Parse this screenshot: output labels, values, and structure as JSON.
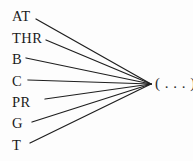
{
  "diagram": {
    "type": "convergence-fan",
    "background_color": "#fdfdfd",
    "line_color": "#1f1f1f",
    "text_color": "#1b1b1b",
    "convergence_point": {
      "x": 151,
      "y": 84
    },
    "target": {
      "label": "( . . . )",
      "x": 155,
      "y": 83
    },
    "nodes": [
      {
        "label": "AT",
        "label_x": 12,
        "label_y": 16,
        "line_x1": 36,
        "line_y1": 19
      },
      {
        "label": "THR",
        "label_x": 12,
        "label_y": 38,
        "line_x1": 46,
        "line_y1": 40
      },
      {
        "label": "B",
        "label_x": 12,
        "label_y": 59,
        "line_x1": 26,
        "line_y1": 58
      },
      {
        "label": "C",
        "label_x": 12,
        "label_y": 81,
        "line_x1": 28,
        "line_y1": 80
      },
      {
        "label": "PR",
        "label_x": 12,
        "label_y": 102,
        "line_x1": 45,
        "line_y1": 99
      },
      {
        "label": "G",
        "label_x": 12,
        "label_y": 123,
        "line_x1": 32,
        "line_y1": 122
      },
      {
        "label": "T",
        "label_x": 12,
        "label_y": 145,
        "line_x1": 30,
        "line_y1": 143
      }
    ]
  }
}
